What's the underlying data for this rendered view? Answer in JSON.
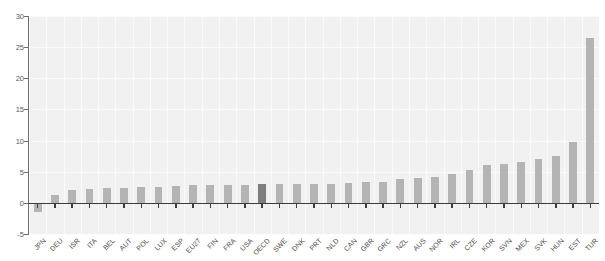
{
  "chart_data": {
    "type": "bar",
    "title": "",
    "xlabel": "",
    "ylabel": "",
    "ylim": [
      -5,
      30
    ],
    "yticks": [
      -5,
      0,
      5,
      10,
      15,
      20,
      25,
      30
    ],
    "grid": true,
    "legend": "none",
    "highlight_category": "OECD",
    "highlight_color": "#7d7d7d",
    "bar_color": "#b4b4b4",
    "plot_background": "#f1f1f1",
    "axis_color": "#3c3c3c",
    "categories": [
      "JPN",
      "DEU",
      "ISR",
      "ITA",
      "BEL",
      "AUT",
      "POL",
      "LUX",
      "ESP",
      "EU27",
      "FIN",
      "FRA",
      "USA",
      "OECD",
      "SWE",
      "DNK",
      "PRT",
      "NLD",
      "CAN",
      "GBR",
      "GRC",
      "NZL",
      "AUS",
      "NOR",
      "IRL",
      "CZE",
      "KOR",
      "SVN",
      "MEX",
      "SVK",
      "HUN",
      "EST",
      "TUR"
    ],
    "values": [
      -1.5,
      1.3,
      2.1,
      2.3,
      2.4,
      2.4,
      2.5,
      2.6,
      2.7,
      2.8,
      2.8,
      2.9,
      2.9,
      3.0,
      3.0,
      3.0,
      3.0,
      3.1,
      3.2,
      3.3,
      3.4,
      3.8,
      4.0,
      4.2,
      4.6,
      5.3,
      6.0,
      6.3,
      6.6,
      7.0,
      7.5,
      9.7,
      26.5
    ]
  },
  "axis": {
    "y_tick_labels": [
      "30",
      "25",
      "20",
      "15",
      "10",
      "5",
      "0",
      "-5"
    ]
  }
}
